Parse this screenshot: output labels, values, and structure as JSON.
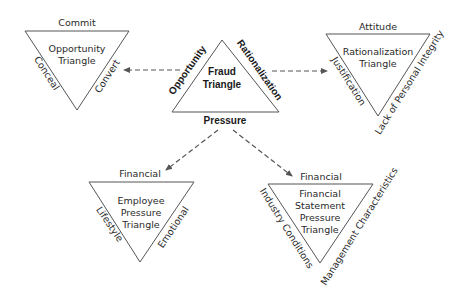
{
  "diagram": {
    "fraud_triangle": {
      "title_line1": "Fraud",
      "title_line2": "Triangle",
      "left_side": "Opportunity",
      "right_side": "Rationalization",
      "bottom": "Pressure"
    },
    "opportunity_triangle": {
      "title_line1": "Opportunity",
      "title_line2": "Triangle",
      "top": "Commit",
      "left_side": "Conceal",
      "right_side": "Convert"
    },
    "rationalization_triangle": {
      "title_line1": "Rationalization",
      "title_line2": "Triangle",
      "top": "Attitude",
      "left_side": "Justification",
      "right_side": "Lack of Personal Integrity"
    },
    "employee_pressure_triangle": {
      "title_line1": "Employee",
      "title_line2": "Pressure",
      "title_line3": "Triangle",
      "top": "Financial",
      "left_side": "Lifestyle",
      "right_side": "Emotional"
    },
    "financial_statement_pressure_triangle": {
      "title_line1": "Financial",
      "title_line2": "Statement",
      "title_line3": "Pressure",
      "title_line4": "Triangle",
      "top": "Financial",
      "left_side": "Industry Conditions",
      "right_side": "Management Characteristics"
    }
  },
  "colors": {
    "line": "#555555",
    "text": "#2a2a2a",
    "background": "#ffffff"
  }
}
